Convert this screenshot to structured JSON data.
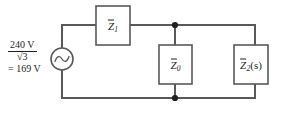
{
  "figure": {
    "name": "single-phase-equivalent-circuit",
    "background_color": "#ffffff",
    "wire_color": "#58595b",
    "text_color": "#231f20",
    "node_color": "#231f20"
  },
  "source": {
    "type": "ac-voltage-source",
    "symbol": "sine",
    "numerator": "240 V",
    "denominator_radical": "3",
    "radical_glyph": "√",
    "equals_line": "= 169 V",
    "value_number": 169,
    "value_unit": "V",
    "nominal_number": 240,
    "nominal_unit": "V",
    "divisor": "√3"
  },
  "components": [
    {
      "id": "z1",
      "symbol": "Z",
      "overbar": true,
      "subscript": "1",
      "argument": "",
      "label_plain": "Z̅1",
      "position": "series-top"
    },
    {
      "id": "z0",
      "symbol": "Z",
      "overbar": true,
      "subscript": "0",
      "argument": "",
      "label_plain": "Z̅0",
      "position": "shunt-middle"
    },
    {
      "id": "z2",
      "symbol": "Z",
      "overbar": true,
      "subscript": "2",
      "argument": "(s)",
      "label_plain": "Z̅2(s)",
      "position": "shunt-right"
    }
  ],
  "nodes": [
    {
      "id": "top-junction",
      "x": 175,
      "y": 25
    },
    {
      "id": "bottom-junction",
      "x": 175,
      "y": 98
    }
  ]
}
